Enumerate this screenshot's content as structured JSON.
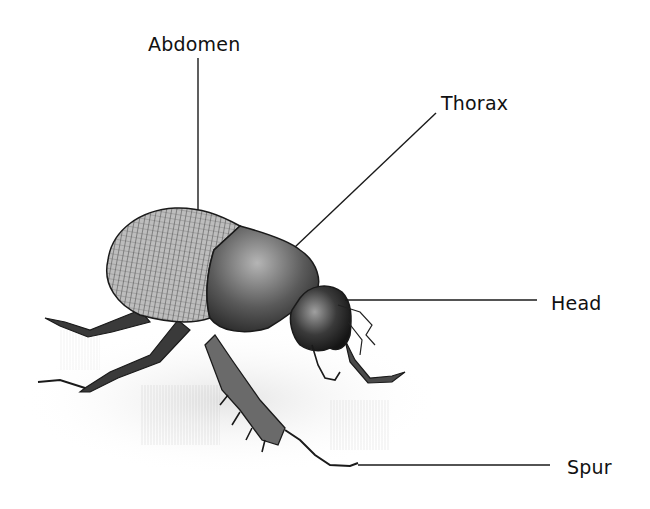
{
  "diagram": {
    "style": "pencil-sketch illustration",
    "line_color": "#1a1a1a",
    "labels": [
      {
        "id": "abdomen",
        "text": "Abdomen",
        "x": 148,
        "y": 44,
        "leader": {
          "x1": 198,
          "y1": 58,
          "x2": 198,
          "y2": 210
        }
      },
      {
        "id": "thorax",
        "text": "Thorax",
        "x": 441,
        "y": 103,
        "leader": {
          "x1": 436,
          "y1": 113,
          "x2": 295,
          "y2": 247
        }
      },
      {
        "id": "head",
        "text": "Head",
        "x": 551,
        "y": 303,
        "leader": {
          "x1": 345,
          "y1": 300,
          "x2": 537,
          "y2": 300
        }
      },
      {
        "id": "spur",
        "text": "Spur",
        "x": 567,
        "y": 467,
        "leader": {
          "x1": 358,
          "y1": 465,
          "x2": 550,
          "y2": 465
        }
      }
    ]
  }
}
